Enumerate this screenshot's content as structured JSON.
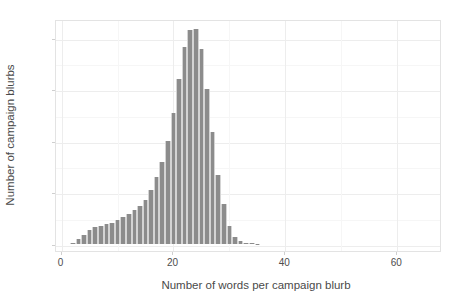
{
  "chart_data": {
    "type": "bar",
    "title": "",
    "xlabel": "Number of words per campaign blurb",
    "ylabel": "Number of campaign blurbs",
    "xlim": [
      -1,
      68
    ],
    "ylim": [
      -700,
      21800
    ],
    "grid": true,
    "legend": null,
    "bar_color": "#8c8c8c",
    "panel_background": "#ffffff",
    "gridline_color": "#ededed",
    "binwidth": 1,
    "xticks": [
      0,
      20,
      40,
      60
    ],
    "xtick_labels": [
      "0",
      "20",
      "40",
      "60"
    ],
    "yticks": [
      0,
      5000,
      10000,
      15000,
      20000
    ],
    "ytick_labels": [
      "0",
      "5000",
      "10000",
      "15000",
      "20000"
    ],
    "categories": [
      2,
      3,
      4,
      5,
      6,
      7,
      8,
      9,
      10,
      11,
      12,
      13,
      14,
      15,
      16,
      17,
      18,
      19,
      20,
      21,
      22,
      23,
      24,
      25,
      26,
      27,
      28,
      29,
      30,
      31,
      32,
      33,
      34,
      35,
      36
    ],
    "values": [
      120,
      430,
      820,
      1350,
      1600,
      1750,
      1900,
      2050,
      2300,
      2600,
      2900,
      3250,
      3700,
      4250,
      5200,
      6500,
      7950,
      9950,
      12700,
      16000,
      19100,
      20700,
      20800,
      18900,
      15000,
      10800,
      6700,
      3900,
      1700,
      700,
      230,
      90,
      40,
      15,
      5
    ]
  },
  "axes": {
    "y_title": "Number of campaign blurbs",
    "x_title": "Number of words per campaign blurb"
  }
}
